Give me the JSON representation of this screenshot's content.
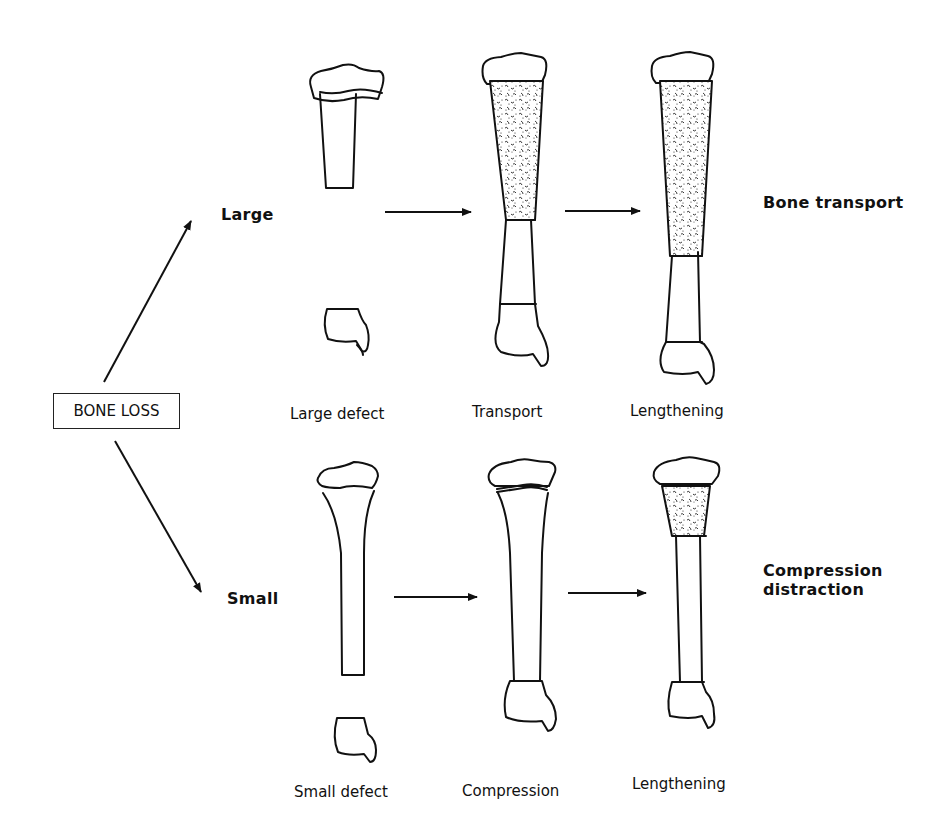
{
  "root": {
    "label": "BONE LOSS"
  },
  "branches": {
    "large": {
      "label": "Large",
      "outcome": "Bone transport",
      "stages": [
        "Large defect",
        "Transport",
        "Lengthening"
      ]
    },
    "small": {
      "label": "Small",
      "outcome_line1": "Compression",
      "outcome_line2": "distraction",
      "stages": [
        "Small defect",
        "Compression",
        "Lengthening"
      ]
    }
  },
  "colors": {
    "ink": "#111111",
    "background": "#ffffff"
  }
}
